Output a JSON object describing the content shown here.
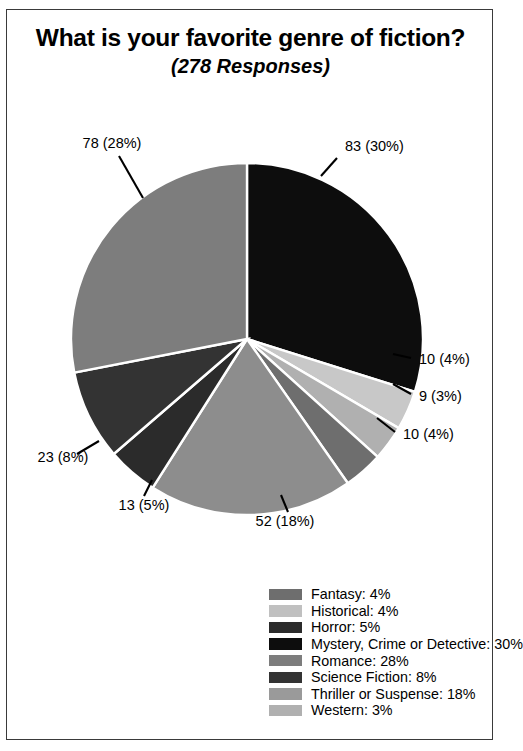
{
  "card": {
    "title": "What is your favorite genre of fiction?",
    "subtitle": "(278 Responses)"
  },
  "chart_data": {
    "type": "pie",
    "title": "What is your favorite genre of fiction?",
    "subtitle": "(278 Responses)",
    "total_responses": 278,
    "xlabel": "",
    "ylabel": "",
    "grid": false,
    "legend_position": "bottom-right",
    "legend_order": "alphabetical",
    "start_angle_deg": 0,
    "direction": "clockwise",
    "categories": [
      "Mystery, Crime or Detective",
      "Historical",
      "Western",
      "Fantasy",
      "Thriller or Suspense",
      "Horror",
      "Science Fiction",
      "Romance"
    ],
    "values": [
      83,
      10,
      9,
      10,
      52,
      13,
      23,
      78
    ],
    "percents": [
      30,
      4,
      3,
      4,
      18,
      5,
      8,
      28
    ],
    "colors": [
      "#0d0d0d",
      "#c8c8c8",
      "#b0b0b0",
      "#6e6e6e",
      "#8d8d8d",
      "#2b2b2b",
      "#333333",
      "#7d7d7d"
    ],
    "slices": [
      {
        "name": "Mystery, Crime or Detective",
        "value": 83,
        "percent": 30,
        "label": "83 (30%)",
        "color": "#0d0d0d",
        "label_x": 338,
        "label_y": 45,
        "label_anchor": "start",
        "leader": {
          "x1": 330,
          "y1": 52,
          "x2": 314,
          "y2": 70
        }
      },
      {
        "name": "Historical",
        "value": 10,
        "percent": 4,
        "label": "10 (4%)",
        "color": "#c8c8c8",
        "label_x": 412,
        "label_y": 258,
        "label_anchor": "start",
        "leader": {
          "x1": 404,
          "y1": 252,
          "x2": 386,
          "y2": 248
        }
      },
      {
        "name": "Western",
        "value": 9,
        "percent": 3,
        "label": "9 (3%)",
        "color": "#b0b0b0",
        "label_x": 412,
        "label_y": 295,
        "label_anchor": "start",
        "leader": {
          "x1": 404,
          "y1": 288,
          "x2": 386,
          "y2": 278
        }
      },
      {
        "name": "Fantasy",
        "value": 10,
        "percent": 4,
        "label": "10 (4%)",
        "color": "#6e6e6e",
        "label_x": 396,
        "label_y": 333,
        "label_anchor": "start",
        "leader": {
          "x1": 388,
          "y1": 326,
          "x2": 370,
          "y2": 312
        }
      },
      {
        "name": "Thriller or Suspense",
        "value": 52,
        "percent": 18,
        "label": "52 (18%)",
        "color": "#8d8d8d",
        "label_x": 278,
        "label_y": 420,
        "label_anchor": "middle",
        "leader": {
          "x1": 281,
          "y1": 406,
          "x2": 274,
          "y2": 389
        }
      },
      {
        "name": "Horror",
        "value": 13,
        "percent": 5,
        "label": "13 (5%)",
        "color": "#2b2b2b",
        "label_x": 137,
        "label_y": 404,
        "label_anchor": "middle",
        "leader": {
          "x1": 137,
          "y1": 390,
          "x2": 145,
          "y2": 374
        }
      },
      {
        "name": "Science Fiction",
        "value": 23,
        "percent": 8,
        "label": "23 (8%)",
        "color": "#333333",
        "label_x": 56,
        "label_y": 356,
        "label_anchor": "middle",
        "leader": {
          "x1": 70,
          "y1": 348,
          "x2": 92,
          "y2": 335
        }
      },
      {
        "name": "Romance",
        "value": 78,
        "percent": 28,
        "label": "78 (28%)",
        "color": "#7d7d7d",
        "label_x": 105,
        "label_y": 42,
        "label_anchor": "middle",
        "leader": {
          "x1": 112,
          "y1": 50,
          "x2": 136,
          "y2": 92
        }
      }
    ],
    "legend": [
      {
        "label": "Fantasy: 4%",
        "color": "#6e6e6e"
      },
      {
        "label": "Historical: 4%",
        "color": "#c0c0c0"
      },
      {
        "label": "Horror: 5%",
        "color": "#2b2b2b"
      },
      {
        "label": "Mystery, Crime or Detective: 30%",
        "color": "#0d0d0d"
      },
      {
        "label": "Romance: 28%",
        "color": "#7d7d7d"
      },
      {
        "label": "Science Fiction: 8%",
        "color": "#333333"
      },
      {
        "label": "Thriller or Suspense: 18%",
        "color": "#9a9a9a"
      },
      {
        "label": "Western: 3%",
        "color": "#b0b0b0"
      }
    ],
    "geometry": {
      "cx": 240,
      "cy": 233,
      "r": 176
    }
  }
}
